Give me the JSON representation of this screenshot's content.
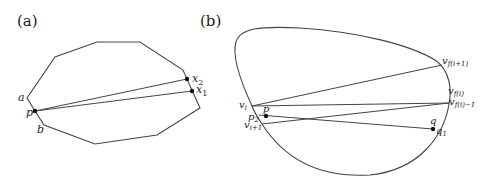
{
  "panels": [
    {
      "caption": "(a)",
      "labels": {
        "a": "a",
        "b": "b",
        "p": "p",
        "x1": "x",
        "x1_sub": "1",
        "x2": "x",
        "x2_sub": "2"
      }
    },
    {
      "caption": "(b)",
      "labels": {
        "vi": "v",
        "vi_sub": "i",
        "vi1": "v",
        "vi1_sub": "i+1",
        "p": "p",
        "p2": "p",
        "p2_sub": "2",
        "q": "q",
        "q1": "q",
        "q1_sub": "1",
        "vfi1": "v",
        "vfi1_sub": "f(i+1)",
        "vfi": "v",
        "vfi_sub": "f(i)",
        "vfim1": "v",
        "vfim1_sub": "f(i)−1"
      }
    }
  ],
  "colors": {
    "stroke": "#333333",
    "text": "#222222"
  }
}
